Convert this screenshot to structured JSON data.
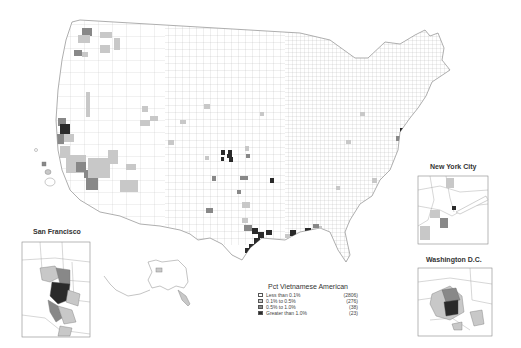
{
  "title": "Pct Vietnamese American",
  "colors": {
    "less_than_0_1": "#ffffff",
    "0_1_to_0_5": "#c8c8c8",
    "0_5_to_1_0": "#888888",
    "greater_than_1_0": "#2a2a2a",
    "border": "#9a9a9a"
  },
  "legend": {
    "title": "Pct Vietnamese American",
    "items": [
      {
        "label": "Less than 0.1%",
        "count": "(2806)",
        "color": "#ffffff"
      },
      {
        "label": "0.1% to 0.5%",
        "count": "(276)",
        "color": "#c8c8c8"
      },
      {
        "label": "0.5% to 1.0%",
        "count": "(38)",
        "color": "#888888"
      },
      {
        "label": "Greater than 1.0%",
        "count": "(23)",
        "color": "#2a2a2a"
      }
    ]
  },
  "insets": {
    "new_york": {
      "title": "New York City"
    },
    "washington": {
      "title": "Washington D.C."
    },
    "san_francisco": {
      "title": "San Francisco"
    }
  }
}
